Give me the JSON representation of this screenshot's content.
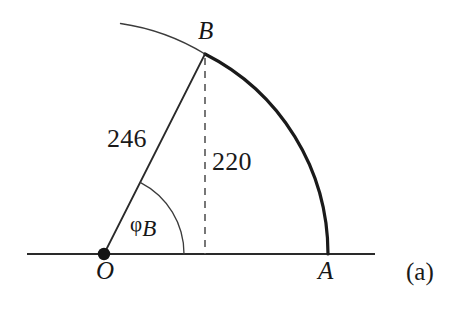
{
  "figure": {
    "panel_label": "(a)",
    "background_color": "#ffffff",
    "ink_color": "#1a1a1a",
    "width": 450,
    "height": 311
  },
  "points": {
    "origin": {
      "name": "O",
      "label": "O",
      "x": 104,
      "y": 254,
      "marker": "filled-dot",
      "label_x": 97,
      "label_y": 259
    },
    "a": {
      "name": "A",
      "label": "A",
      "x": 328,
      "y": 254,
      "marker": "none",
      "label_x": 318,
      "label_y": 259
    },
    "b": {
      "name": "B",
      "label": "B",
      "x": 205,
      "y": 54,
      "marker": "none",
      "label_x": 198,
      "label_y": 20
    }
  },
  "measurements": {
    "radius": {
      "label": "246",
      "value": 246,
      "label_x": 108,
      "label_y": 127,
      "describes": "segment-OB"
    },
    "height": {
      "label": "220",
      "value": 220,
      "label_x": 212,
      "label_y": 149,
      "describes": "dashed-vertical-from-B"
    }
  },
  "angle": {
    "label_phi": "φ",
    "label_subscript": "B",
    "label_x": 131,
    "label_y": 213,
    "arc_radius": 80,
    "describes": "angle-between-OB-and-baseline"
  },
  "geometry": {
    "baseline": {
      "x1": 27,
      "y1": 254,
      "x2": 375,
      "y2": 254,
      "stroke_width": 2.2
    },
    "segment_ob": {
      "x1": 104,
      "y1": 254,
      "x2": 205,
      "y2": 54,
      "stroke_width": 1.8
    },
    "dashed_drop": {
      "x1": 205,
      "y1": 58,
      "x2": 205,
      "y2": 254,
      "stroke_width": 1.6,
      "dash": "7 6"
    },
    "thick_arc": {
      "from": "B",
      "to": "A",
      "center_x": 104,
      "center_y": 254,
      "radius": 224,
      "stroke_width": 3.2,
      "style": "solid-heavy"
    },
    "thin_arc": {
      "from_x": 120,
      "from_y": 23,
      "to": "B",
      "center_x": 104,
      "center_y": 254,
      "radius": 224,
      "stroke_width": 1.3,
      "style": "solid-light"
    },
    "angle_arc": {
      "center_x": 104,
      "center_y": 254,
      "radius": 80,
      "start_x": 144,
      "start_y": 185,
      "end_x": 184,
      "end_y": 254,
      "stroke_width": 1.3
    }
  }
}
